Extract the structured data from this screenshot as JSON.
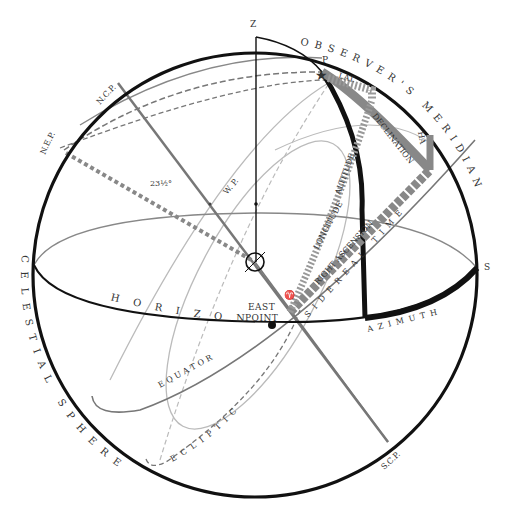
{
  "diagram": {
    "title": "Celestial Sphere",
    "colors": {
      "sphere": "#111111",
      "horizon": "#111111",
      "equator": "#777777",
      "ecliptic": "#888888",
      "axis": "#777777",
      "light_line": "#bbbbbb",
      "band_gray": "#888888",
      "band_black": "#111111"
    },
    "labels": {
      "zenith": "Z",
      "ncp": "N.C.P.",
      "nep": "N.E.P.",
      "scp": "S.C.P.",
      "obliquity": "23½°",
      "wp": "W. P.",
      "pole_star": "P",
      "lat": "LAT.",
      "declination": "DECLINATION",
      "hour_angle": "HA",
      "longitude": "LONGITUDE",
      "altitude": "ALTITUDE",
      "right_ascension": "RIGHT ASCENSION",
      "sidereal_time": "SIDEREAL TIME",
      "azimuth": "AZIMUTH",
      "south": "S",
      "east_point_line1": "EAST",
      "east_point_line2": "POINT",
      "vernal_equinox": "♈",
      "horizon": "HORIZON",
      "equator": "EQUATOR",
      "ecliptic": "ECLIPTIC",
      "observers_meridian": "OBSERVER'S MERIDIAN",
      "meridian_symbol": "Σ",
      "celestial_sphere": "CELESTIAL SPHERE"
    }
  }
}
